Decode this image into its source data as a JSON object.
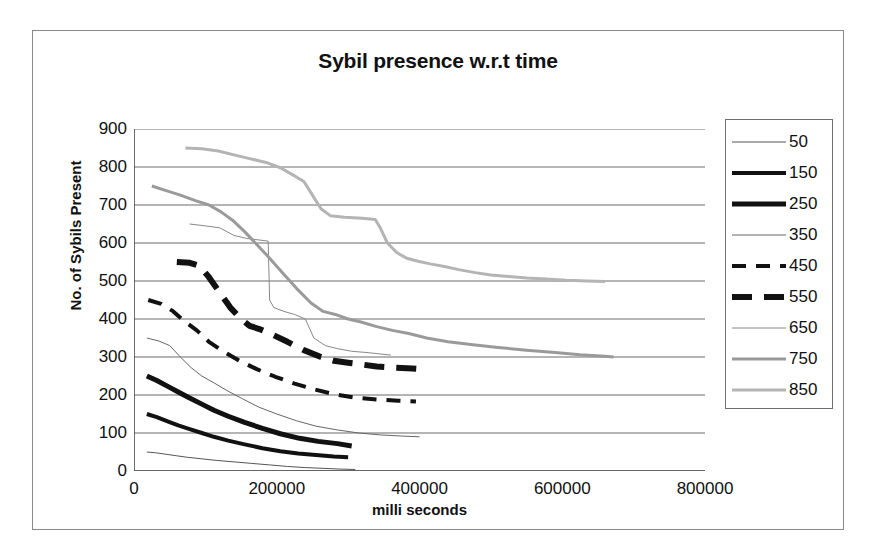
{
  "chart_data": {
    "type": "line",
    "title": "Sybil presence w.r.t time",
    "xlabel": "milli seconds",
    "ylabel": "No. of Sybils Present",
    "xlim": [
      0,
      800000
    ],
    "ylim": [
      0,
      900
    ],
    "xticks": [
      "0",
      "200000",
      "400000",
      "600000",
      "800000"
    ],
    "xtick_values": [
      0,
      200000,
      400000,
      600000,
      800000
    ],
    "yticks": [
      "0",
      "100",
      "200",
      "300",
      "400",
      "500",
      "600",
      "700",
      "800",
      "900"
    ],
    "ytick_values": [
      0,
      100,
      200,
      300,
      400,
      500,
      600,
      700,
      800,
      900
    ],
    "grid": "horizontal",
    "legend_position": "right",
    "series": [
      {
        "name": "50",
        "style": "thin-solid",
        "color": "#555555",
        "width": 1,
        "dash": "none",
        "points": [
          [
            18000,
            50
          ],
          [
            30000,
            48
          ],
          [
            45000,
            44
          ],
          [
            60000,
            40
          ],
          [
            75000,
            36
          ],
          [
            95000,
            32
          ],
          [
            115000,
            28
          ],
          [
            140000,
            24
          ],
          [
            165000,
            20
          ],
          [
            190000,
            16
          ],
          [
            215000,
            12
          ],
          [
            240000,
            9
          ],
          [
            265000,
            7
          ],
          [
            290000,
            5
          ],
          [
            310000,
            4
          ]
        ]
      },
      {
        "name": "150",
        "style": "thick-solid",
        "color": "#111111",
        "width": 4,
        "dash": "none",
        "points": [
          [
            18000,
            150
          ],
          [
            32000,
            142
          ],
          [
            48000,
            130
          ],
          [
            62000,
            120
          ],
          [
            78000,
            110
          ],
          [
            95000,
            100
          ],
          [
            112000,
            90
          ],
          [
            132000,
            80
          ],
          [
            155000,
            70
          ],
          [
            180000,
            60
          ],
          [
            205000,
            52
          ],
          [
            230000,
            46
          ],
          [
            255000,
            42
          ],
          [
            280000,
            38
          ],
          [
            300000,
            36
          ]
        ]
      },
      {
        "name": "250",
        "style": "extra-thick-solid",
        "color": "#111111",
        "width": 5,
        "dash": "none",
        "points": [
          [
            18000,
            250
          ],
          [
            32000,
            238
          ],
          [
            48000,
            222
          ],
          [
            62000,
            208
          ],
          [
            78000,
            192
          ],
          [
            95000,
            176
          ],
          [
            112000,
            160
          ],
          [
            132000,
            144
          ],
          [
            155000,
            128
          ],
          [
            180000,
            112
          ],
          [
            205000,
            98
          ],
          [
            232000,
            86
          ],
          [
            258000,
            78
          ],
          [
            285000,
            72
          ],
          [
            305000,
            66
          ]
        ]
      },
      {
        "name": "350",
        "style": "thin-solid",
        "color": "#666666",
        "width": 1,
        "dash": "none",
        "points": [
          [
            18000,
            350
          ],
          [
            35000,
            342
          ],
          [
            50000,
            330
          ],
          [
            65000,
            300
          ],
          [
            80000,
            272
          ],
          [
            95000,
            250
          ],
          [
            112000,
            232
          ],
          [
            130000,
            212
          ],
          [
            152000,
            190
          ],
          [
            175000,
            168
          ],
          [
            200000,
            150
          ],
          [
            228000,
            132
          ],
          [
            255000,
            118
          ],
          [
            285000,
            108
          ],
          [
            315000,
            100
          ],
          [
            345000,
            95
          ],
          [
            375000,
            92
          ],
          [
            400000,
            90
          ]
        ]
      },
      {
        "name": "450",
        "style": "thin-dashed",
        "color": "#111111",
        "width": 4,
        "dash": "14,10",
        "points": [
          [
            20000,
            450
          ],
          [
            38000,
            440
          ],
          [
            55000,
            420
          ],
          [
            70000,
            395
          ],
          [
            88000,
            370
          ],
          [
            105000,
            340
          ],
          [
            125000,
            315
          ],
          [
            148000,
            290
          ],
          [
            172000,
            268
          ],
          [
            198000,
            248
          ],
          [
            225000,
            230
          ],
          [
            252000,
            215
          ],
          [
            280000,
            202
          ],
          [
            310000,
            193
          ],
          [
            340000,
            188
          ],
          [
            370000,
            185
          ],
          [
            395000,
            183
          ]
        ]
      },
      {
        "name": "550",
        "style": "thick-dashed",
        "color": "#111111",
        "width": 6,
        "dash": "20,12",
        "points": [
          [
            60000,
            550
          ],
          [
            78000,
            548
          ],
          [
            92000,
            540
          ],
          [
            105000,
            510
          ],
          [
            120000,
            470
          ],
          [
            135000,
            430
          ],
          [
            150000,
            400
          ],
          [
            162000,
            382
          ],
          [
            178000,
            372
          ],
          [
            195000,
            358
          ],
          [
            215000,
            340
          ],
          [
            238000,
            318
          ],
          [
            262000,
            300
          ],
          [
            280000,
            290
          ],
          [
            300000,
            285
          ],
          [
            320000,
            280
          ],
          [
            340000,
            275
          ],
          [
            365000,
            272
          ],
          [
            390000,
            270
          ],
          [
            405000,
            268
          ]
        ]
      },
      {
        "name": "650",
        "style": "thin-solid",
        "color": "#888888",
        "width": 1,
        "dash": "none",
        "points": [
          [
            78000,
            650
          ],
          [
            100000,
            645
          ],
          [
            120000,
            640
          ],
          [
            140000,
            620
          ],
          [
            158000,
            612
          ],
          [
            175000,
            608
          ],
          [
            188000,
            605
          ],
          [
            190000,
            450
          ],
          [
            196000,
            430
          ],
          [
            210000,
            420
          ],
          [
            225000,
            412
          ],
          [
            240000,
            400
          ],
          [
            252000,
            350
          ],
          [
            268000,
            330
          ],
          [
            285000,
            322
          ],
          [
            305000,
            315
          ],
          [
            325000,
            312
          ],
          [
            345000,
            308
          ],
          [
            360000,
            305
          ]
        ]
      },
      {
        "name": "750",
        "style": "medium-solid",
        "color": "#9a9a9a",
        "width": 3,
        "dash": "none",
        "points": [
          [
            25000,
            750
          ],
          [
            45000,
            738
          ],
          [
            65000,
            726
          ],
          [
            85000,
            712
          ],
          [
            105000,
            700
          ],
          [
            122000,
            682
          ],
          [
            138000,
            660
          ],
          [
            155000,
            630
          ],
          [
            172000,
            596
          ],
          [
            190000,
            560
          ],
          [
            208000,
            522
          ],
          [
            228000,
            480
          ],
          [
            248000,
            442
          ],
          [
            265000,
            420
          ],
          [
            282000,
            412
          ],
          [
            300000,
            400
          ],
          [
            318000,
            392
          ],
          [
            340000,
            380
          ],
          [
            362000,
            370
          ],
          [
            385000,
            362
          ],
          [
            410000,
            350
          ],
          [
            440000,
            340
          ],
          [
            475000,
            332
          ],
          [
            510000,
            325
          ],
          [
            550000,
            318
          ],
          [
            590000,
            312
          ],
          [
            625000,
            306
          ],
          [
            660000,
            302
          ],
          [
            672000,
            300
          ]
        ]
      },
      {
        "name": "850",
        "style": "medium-solid",
        "color": "#b4b4b4",
        "width": 3,
        "dash": "none",
        "points": [
          [
            72000,
            850
          ],
          [
            95000,
            848
          ],
          [
            118000,
            842
          ],
          [
            140000,
            832
          ],
          [
            162000,
            822
          ],
          [
            185000,
            812
          ],
          [
            205000,
            798
          ],
          [
            222000,
            780
          ],
          [
            238000,
            762
          ],
          [
            252000,
            720
          ],
          [
            262000,
            690
          ],
          [
            275000,
            672
          ],
          [
            295000,
            668
          ],
          [
            320000,
            665
          ],
          [
            338000,
            662
          ],
          [
            345000,
            640
          ],
          [
            355000,
            600
          ],
          [
            368000,
            575
          ],
          [
            382000,
            560
          ],
          [
            398000,
            552
          ],
          [
            415000,
            545
          ],
          [
            435000,
            538
          ],
          [
            455000,
            530
          ],
          [
            478000,
            522
          ],
          [
            500000,
            516
          ],
          [
            525000,
            512
          ],
          [
            550000,
            508
          ],
          [
            578000,
            505
          ],
          [
            605000,
            502
          ],
          [
            635000,
            500
          ],
          [
            660000,
            499
          ]
        ]
      }
    ]
  },
  "legend": {
    "entries": [
      {
        "label": "50",
        "swatch": "thin-solid",
        "color": "#555555",
        "width": 1,
        "dash": "none"
      },
      {
        "label": "150",
        "swatch": "thick-solid",
        "color": "#111111",
        "width": 4,
        "dash": "none"
      },
      {
        "label": "250",
        "swatch": "extra-thick-solid",
        "color": "#111111",
        "width": 5,
        "dash": "none"
      },
      {
        "label": "350",
        "swatch": "thin-solid",
        "color": "#666666",
        "width": 1,
        "dash": "none"
      },
      {
        "label": "450",
        "swatch": "thin-dashed",
        "color": "#111111",
        "width": 4,
        "dash": "14,10"
      },
      {
        "label": "550",
        "swatch": "thick-dashed",
        "color": "#111111",
        "width": 6,
        "dash": "20,12"
      },
      {
        "label": "650",
        "swatch": "thin-solid",
        "color": "#888888",
        "width": 1,
        "dash": "none"
      },
      {
        "label": "750",
        "swatch": "medium-solid",
        "color": "#9a9a9a",
        "width": 3,
        "dash": "none"
      },
      {
        "label": "850",
        "swatch": "medium-solid",
        "color": "#b4b4b4",
        "width": 3,
        "dash": "none"
      }
    ]
  },
  "colors": {
    "frame_border": "#8a8a8a",
    "legend_border": "#6f6f6f",
    "axis": "#4a4a4a",
    "gridline": "#6a6a6a",
    "text": "#111111",
    "background": "#ffffff"
  }
}
